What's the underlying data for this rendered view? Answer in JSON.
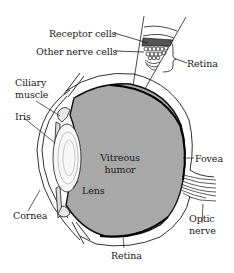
{
  "diagram": {
    "type": "anatomical cross-section of the human eye",
    "colors": {
      "vitreous_fill": "#a8a8a8",
      "outline": "#1a1a1a",
      "background": "#ffffff"
    },
    "labels": {
      "receptor_cells": "Receptor cells",
      "other_nerve_cells": "Other nerve cells",
      "retina_inset": "Retina",
      "ciliary_muscle_1": "Ciliary",
      "ciliary_muscle_2": "muscle",
      "iris": "Iris",
      "vitreous_humor_1": "Vitreous",
      "vitreous_humor_2": "humor",
      "fovea": "Fovea",
      "lens": "Lens",
      "cornea": "Cornea",
      "optic_nerve_1": "Optic",
      "optic_nerve_2": "nerve",
      "retina_bottom": "Retina"
    }
  }
}
